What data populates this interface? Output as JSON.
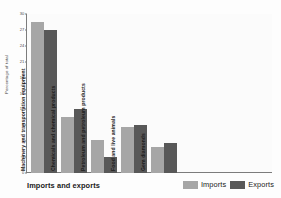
{
  "chart_data": {
    "type": "bar",
    "title": "",
    "xlabel": "Imports and exports",
    "ylabel": "Percentage of total",
    "ylim": [
      0,
      30
    ],
    "yticks": [
      30,
      27,
      24,
      21,
      18,
      15,
      12,
      9,
      6,
      3,
      0
    ],
    "grid": false,
    "legend_position": "bottom-right",
    "categories": [
      "Machinery and transportation equipment",
      "Chemicals and chemical products",
      "Petroleum and petroleum products",
      "Food and live animals",
      "Gem diamonds"
    ],
    "series": [
      {
        "name": "Imports",
        "color": "#a6a6a6",
        "values": [
          28.5,
          10.5,
          6.2,
          8.6,
          5.0
        ]
      },
      {
        "name": "Exports",
        "color": "#585858",
        "values": [
          27.0,
          12.0,
          3.0,
          9.0,
          5.6
        ]
      }
    ]
  },
  "legend": {
    "items": [
      {
        "label": "Imports",
        "color": "#a6a6a6"
      },
      {
        "label": "Exports",
        "color": "#585858"
      }
    ]
  }
}
